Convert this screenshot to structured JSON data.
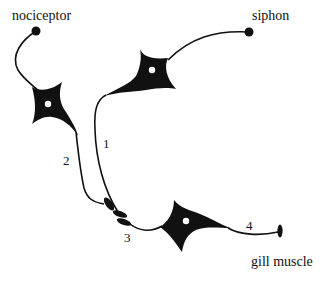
{
  "diagram": {
    "title": "",
    "labels": {
      "nociceptor": "nociceptor",
      "siphon": "siphon",
      "gill_muscle": "gill muscle"
    },
    "pathway_numbers": {
      "n1": "1",
      "n2": "2",
      "n3": "3",
      "n4": "4"
    },
    "neurons": [
      {
        "id": "nociceptor-neuron",
        "role": "sensory neuron from nociceptor"
      },
      {
        "id": "siphon-neuron",
        "role": "sensory neuron from siphon"
      },
      {
        "id": "motor-neuron",
        "role": "motor neuron to gill muscle"
      }
    ],
    "colors": {
      "ink": "#111111",
      "background": "#ffffff"
    }
  }
}
